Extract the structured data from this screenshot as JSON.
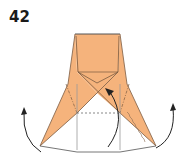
{
  "step": {
    "number": "42"
  },
  "diagram": {
    "type": "origami-fold-step",
    "paper_color": "#f5b37c",
    "line_color": "#6b6b6b",
    "outline_color": "#555555",
    "arrow_color": "#222222",
    "arrows": [
      {
        "name": "left-rotate-arrow",
        "direction": "up"
      },
      {
        "name": "center-tuck-arrow",
        "direction": "up"
      },
      {
        "name": "right-rotate-arrow",
        "direction": "up"
      }
    ]
  }
}
